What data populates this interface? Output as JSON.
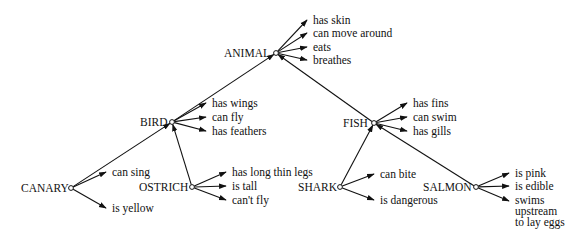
{
  "diagram": {
    "type": "semantic-network",
    "colors": {
      "ink": "#111111",
      "background": "#ffffff"
    },
    "nodes": [
      {
        "id": "animal",
        "label": "ANIMAL",
        "x": 276,
        "y": 53,
        "label_x": 224,
        "label_y": 57,
        "properties": [
          {
            "text": [
              "has skin"
            ],
            "x": 313,
            "y": 24
          },
          {
            "text": [
              "can move around"
            ],
            "x": 313,
            "y": 37
          },
          {
            "text": [
              "eats"
            ],
            "x": 313,
            "y": 51
          },
          {
            "text": [
              "breathes"
            ],
            "x": 313,
            "y": 64
          }
        ]
      },
      {
        "id": "bird",
        "label": "BIRD",
        "x": 172,
        "y": 122,
        "label_x": 140,
        "label_y": 126,
        "parent": "animal",
        "properties": [
          {
            "text": [
              "has wings"
            ],
            "x": 212,
            "y": 107
          },
          {
            "text": [
              "can fly"
            ],
            "x": 212,
            "y": 121
          },
          {
            "text": [
              "has feathers"
            ],
            "x": 212,
            "y": 135
          }
        ]
      },
      {
        "id": "fish",
        "label": "FISH",
        "x": 374,
        "y": 123,
        "label_x": 343,
        "label_y": 127,
        "parent": "animal",
        "properties": [
          {
            "text": [
              "has fins"
            ],
            "x": 413,
            "y": 107
          },
          {
            "text": [
              "can swim"
            ],
            "x": 413,
            "y": 121
          },
          {
            "text": [
              "has gills"
            ],
            "x": 413,
            "y": 135
          }
        ]
      },
      {
        "id": "canary",
        "label": "CANARY",
        "x": 71,
        "y": 188,
        "label_x": 21,
        "label_y": 192,
        "parent": "bird",
        "properties": [
          {
            "text": [
              "can sing"
            ],
            "x": 112,
            "y": 176
          },
          {
            "text": [
              "is yellow"
            ],
            "x": 112,
            "y": 212
          }
        ]
      },
      {
        "id": "ostrich",
        "label": "OSTRICH",
        "x": 192,
        "y": 187,
        "label_x": 139,
        "label_y": 191,
        "parent": "bird",
        "properties": [
          {
            "text": [
              "has long thin legs"
            ],
            "x": 232,
            "y": 176
          },
          {
            "text": [
              "is tall"
            ],
            "x": 232,
            "y": 190
          },
          {
            "text": [
              "can't fly"
            ],
            "x": 232,
            "y": 204
          }
        ]
      },
      {
        "id": "shark",
        "label": "SHARK",
        "x": 340,
        "y": 187,
        "label_x": 298,
        "label_y": 191,
        "parent": "fish",
        "properties": [
          {
            "text": [
              "can bite"
            ],
            "x": 380,
            "y": 178
          },
          {
            "text": [
              "is dangerous"
            ],
            "x": 380,
            "y": 204
          }
        ]
      },
      {
        "id": "salmon",
        "label": "SALMON",
        "x": 476,
        "y": 187,
        "label_x": 423,
        "label_y": 191,
        "parent": "fish",
        "properties": [
          {
            "text": [
              "is pink"
            ],
            "x": 515,
            "y": 177
          },
          {
            "text": [
              "is edible"
            ],
            "x": 515,
            "y": 190
          },
          {
            "text": [
              "swims",
              "upstream",
              "to lay eggs"
            ],
            "x": 515,
            "y": 204,
            "arrow_y": 201
          }
        ]
      }
    ]
  }
}
